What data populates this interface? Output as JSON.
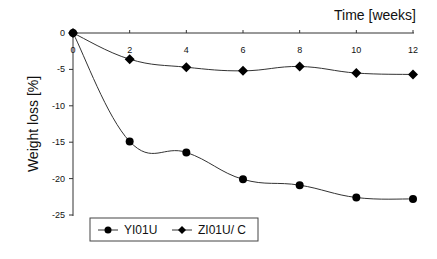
{
  "chart_data": {
    "type": "line",
    "title": "",
    "xlabel": "Time  [weeks]",
    "ylabel": "Weight  loss [%]",
    "x": [
      0,
      2,
      4,
      6,
      8,
      10,
      12
    ],
    "x_ticks": [
      "0",
      "2",
      "4",
      "6",
      "8",
      "10",
      "12"
    ],
    "y_ticks": [
      "0",
      "-5",
      "-10",
      "-15",
      "-20",
      "-25"
    ],
    "ylim": [
      -25,
      0
    ],
    "xlim": [
      0,
      12
    ],
    "grid": false,
    "legend_position": "bottom",
    "series": [
      {
        "name": "YI01U",
        "marker": "circle",
        "values": [
          0,
          -14.9,
          -16.4,
          -20.1,
          -20.9,
          -22.6,
          -22.8
        ]
      },
      {
        "name": "ZI01U/ C",
        "marker": "diamond",
        "values": [
          0,
          -3.6,
          -4.7,
          -5.2,
          -4.6,
          -5.5,
          -5.7
        ]
      }
    ]
  },
  "legend": {
    "items": [
      {
        "label": "YI01U"
      },
      {
        "label": "ZI01U/ C"
      }
    ]
  }
}
